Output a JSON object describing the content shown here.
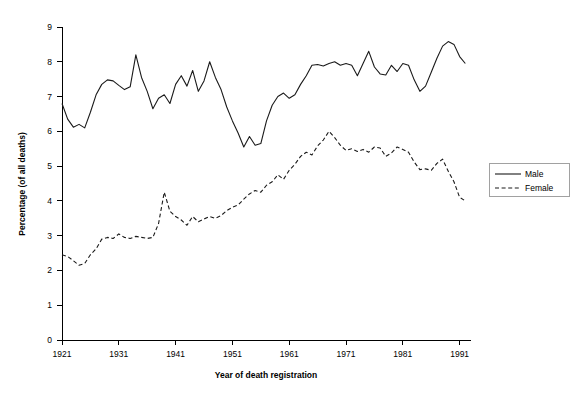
{
  "chart_data": {
    "type": "line",
    "title": "",
    "xlabel": "Year of death registration",
    "ylabel": "Percentage (of all deaths)",
    "xlim": [
      1921,
      1993
    ],
    "ylim": [
      0,
      9
    ],
    "grid": false,
    "legend_position": "right",
    "xticks": [
      1921,
      1931,
      1941,
      1951,
      1961,
      1971,
      1981,
      1991
    ],
    "xtick_labels": [
      "1921",
      "1931",
      "1941",
      "1951",
      "1961",
      "1971",
      "1981",
      "1991"
    ],
    "yticks": [
      0,
      1,
      2,
      3,
      4,
      5,
      6,
      7,
      8,
      9
    ],
    "ytick_labels": [
      "0",
      "1",
      "2",
      "3",
      "4",
      "5",
      "6",
      "7",
      "8",
      "9"
    ],
    "x": [
      1921,
      1922,
      1923,
      1924,
      1925,
      1926,
      1927,
      1928,
      1929,
      1930,
      1931,
      1932,
      1933,
      1934,
      1935,
      1936,
      1937,
      1938,
      1939,
      1940,
      1941,
      1942,
      1943,
      1944,
      1945,
      1946,
      1947,
      1948,
      1949,
      1950,
      1951,
      1952,
      1953,
      1954,
      1955,
      1956,
      1957,
      1958,
      1959,
      1960,
      1961,
      1962,
      1963,
      1964,
      1965,
      1966,
      1967,
      1968,
      1969,
      1970,
      1971,
      1972,
      1973,
      1974,
      1975,
      1976,
      1977,
      1978,
      1979,
      1980,
      1981,
      1982,
      1983,
      1984,
      1985,
      1986,
      1987,
      1988,
      1989,
      1990,
      1991,
      1992
    ],
    "series": [
      {
        "name": "Male",
        "style": "solid",
        "color": "#1a1a1a",
        "values": [
          6.8,
          6.35,
          6.12,
          6.2,
          6.1,
          6.55,
          7.05,
          7.35,
          7.48,
          7.45,
          7.32,
          7.2,
          7.28,
          8.2,
          7.55,
          7.15,
          6.65,
          6.95,
          7.05,
          6.8,
          7.35,
          7.6,
          7.3,
          7.75,
          7.15,
          7.45,
          8.0,
          7.55,
          7.2,
          6.7,
          6.3,
          5.95,
          5.55,
          5.85,
          5.6,
          5.65,
          6.3,
          6.75,
          7.0,
          7.1,
          6.95,
          7.05,
          7.35,
          7.6,
          7.9,
          7.92,
          7.88,
          7.95,
          8.0,
          7.9,
          7.95,
          7.9,
          7.6,
          7.95,
          8.3,
          7.85,
          7.65,
          7.62,
          7.9,
          7.72,
          7.95,
          7.9,
          7.48,
          7.15,
          7.3,
          7.7,
          8.1,
          8.45,
          8.58,
          8.5,
          8.15,
          7.95
        ]
      },
      {
        "name": "Female",
        "style": "dashed",
        "color": "#1a1a1a",
        "values": [
          2.45,
          2.4,
          2.28,
          2.15,
          2.2,
          2.45,
          2.62,
          2.9,
          2.95,
          2.92,
          3.05,
          2.95,
          2.92,
          2.98,
          2.95,
          2.92,
          2.95,
          3.35,
          4.25,
          3.7,
          3.55,
          3.45,
          3.3,
          3.55,
          3.4,
          3.48,
          3.55,
          3.5,
          3.58,
          3.72,
          3.82,
          3.88,
          4.05,
          4.2,
          4.3,
          4.25,
          4.45,
          4.55,
          4.75,
          4.62,
          4.88,
          5.05,
          5.28,
          5.4,
          5.32,
          5.58,
          5.75,
          6.0,
          5.82,
          5.6,
          5.45,
          5.5,
          5.42,
          5.48,
          5.4,
          5.55,
          5.52,
          5.28,
          5.38,
          5.55,
          5.48,
          5.4,
          5.12,
          4.9,
          4.92,
          4.88,
          5.08,
          5.2,
          4.85,
          4.55,
          4.1,
          4.0
        ]
      }
    ],
    "legend_entries": [
      {
        "label": "Male",
        "style": "solid"
      },
      {
        "label": "Female",
        "style": "dashed"
      }
    ]
  }
}
